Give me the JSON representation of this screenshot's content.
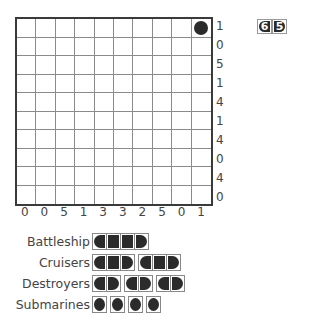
{
  "puzzle": {
    "number_digits": [
      "6",
      "5"
    ],
    "grid_size": 10,
    "row_clues": [
      "1",
      "0",
      "5",
      "1",
      "4",
      "1",
      "4",
      "0",
      "4",
      "0"
    ],
    "col_clues": [
      "0",
      "0",
      "5",
      "1",
      "3",
      "3",
      "2",
      "5",
      "0",
      "1"
    ],
    "given_cells": [
      {
        "row": 0,
        "col": 9,
        "type": "submarine"
      }
    ]
  },
  "fleet": [
    {
      "label": "Battleship",
      "ships": [
        4
      ]
    },
    {
      "label": "Cruisers",
      "ships": [
        3,
        3
      ]
    },
    {
      "label": "Destroyers",
      "ships": [
        2,
        2,
        2
      ]
    },
    {
      "label": "Submarines",
      "ships": [
        1,
        1,
        1,
        1
      ]
    }
  ],
  "colors": {
    "ship": "#2b2b2b",
    "grid_line": "#8a8a8a",
    "border": "#3a3a3a"
  }
}
